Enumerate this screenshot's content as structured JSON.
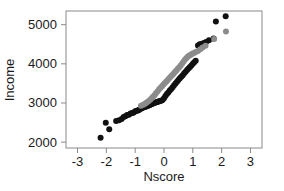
{
  "chart_data": {
    "type": "scatter",
    "title": "",
    "xlabel": "Nscore",
    "ylabel": "Income",
    "xlim": [
      -3.4,
      3.4
    ],
    "ylim": [
      1850,
      5350
    ],
    "xticks": [
      -3,
      -2,
      -1,
      0,
      1,
      2,
      3
    ],
    "xtick_labels": [
      "-3",
      "-2",
      "-1",
      "0",
      "1",
      "2",
      "3"
    ],
    "yticks": [
      2000,
      3000,
      4000,
      5000
    ],
    "ytick_labels": [
      "2000",
      "3000",
      "4000",
      "5000"
    ],
    "grid": false,
    "legend": "none",
    "frame": true,
    "series": [
      {
        "name": "black-series",
        "color": "#111111",
        "marker": "filled-circle",
        "marker_size": 3.0,
        "points": [
          [
            -2.2,
            2110
          ],
          [
            -2.02,
            2495
          ],
          [
            -1.9,
            2330
          ],
          [
            -1.66,
            2540
          ],
          [
            -1.56,
            2560
          ],
          [
            -1.47,
            2590
          ],
          [
            -1.4,
            2640
          ],
          [
            -1.34,
            2660
          ],
          [
            -1.28,
            2690
          ],
          [
            -1.22,
            2700
          ],
          [
            -1.16,
            2730
          ],
          [
            -1.1,
            2745
          ],
          [
            -1.05,
            2760
          ],
          [
            -1.0,
            2790
          ],
          [
            -0.95,
            2800
          ],
          [
            -0.9,
            2805
          ],
          [
            -0.86,
            2830
          ],
          [
            -0.82,
            2850
          ],
          [
            -0.78,
            2860
          ],
          [
            -0.74,
            2880
          ],
          [
            -0.7,
            2890
          ],
          [
            -0.66,
            2900
          ],
          [
            -0.62,
            2910
          ],
          [
            -0.58,
            2920
          ],
          [
            -0.54,
            2935
          ],
          [
            -0.5,
            2945
          ],
          [
            -0.46,
            2960
          ],
          [
            -0.42,
            2975
          ],
          [
            -0.38,
            2985
          ],
          [
            -0.34,
            3000
          ],
          [
            -0.3,
            3010
          ],
          [
            -0.26,
            3020
          ],
          [
            -0.22,
            3030
          ],
          [
            -0.18,
            3040
          ],
          [
            -0.14,
            3050
          ],
          [
            -0.1,
            3060
          ],
          [
            -0.05,
            3075
          ],
          [
            0.0,
            3120
          ],
          [
            0.05,
            3180
          ],
          [
            0.1,
            3230
          ],
          [
            0.15,
            3270
          ],
          [
            0.2,
            3320
          ],
          [
            0.25,
            3360
          ],
          [
            0.3,
            3400
          ],
          [
            0.35,
            3450
          ],
          [
            0.4,
            3500
          ],
          [
            0.45,
            3545
          ],
          [
            0.5,
            3590
          ],
          [
            0.55,
            3630
          ],
          [
            0.6,
            3670
          ],
          [
            0.65,
            3710
          ],
          [
            0.7,
            3760
          ],
          [
            0.75,
            3800
          ],
          [
            0.8,
            3840
          ],
          [
            0.85,
            3880
          ],
          [
            0.9,
            3920
          ],
          [
            0.95,
            3960
          ],
          [
            1.0,
            4000
          ],
          [
            1.05,
            4040
          ],
          [
            1.1,
            4080
          ],
          [
            1.18,
            4470
          ],
          [
            1.24,
            4500
          ],
          [
            1.3,
            4510
          ],
          [
            1.38,
            4530
          ],
          [
            1.46,
            4560
          ],
          [
            1.56,
            4600
          ],
          [
            1.72,
            4650
          ],
          [
            1.8,
            5080
          ],
          [
            2.14,
            5215
          ]
        ]
      },
      {
        "name": "gray-series",
        "color": "#8c8c8c",
        "marker": "filled-circle",
        "marker_size": 3.0,
        "points": [
          [
            -0.8,
            2930
          ],
          [
            -0.72,
            2955
          ],
          [
            -0.66,
            2980
          ],
          [
            -0.6,
            3010
          ],
          [
            -0.54,
            3045
          ],
          [
            -0.48,
            3080
          ],
          [
            -0.43,
            3120
          ],
          [
            -0.38,
            3160
          ],
          [
            -0.33,
            3200
          ],
          [
            -0.28,
            3250
          ],
          [
            -0.22,
            3300
          ],
          [
            -0.17,
            3350
          ],
          [
            -0.12,
            3390
          ],
          [
            -0.07,
            3430
          ],
          [
            -0.02,
            3470
          ],
          [
            0.03,
            3510
          ],
          [
            0.08,
            3550
          ],
          [
            0.13,
            3590
          ],
          [
            0.18,
            3630
          ],
          [
            0.23,
            3670
          ],
          [
            0.28,
            3710
          ],
          [
            0.33,
            3750
          ],
          [
            0.38,
            3790
          ],
          [
            0.43,
            3830
          ],
          [
            0.48,
            3875
          ],
          [
            0.53,
            3915
          ],
          [
            0.58,
            3960
          ],
          [
            0.63,
            4010
          ],
          [
            0.68,
            4060
          ],
          [
            0.73,
            4110
          ],
          [
            0.78,
            4150
          ],
          [
            0.83,
            4190
          ],
          [
            0.88,
            4215
          ],
          [
            0.93,
            4235
          ],
          [
            0.98,
            4255
          ],
          [
            1.04,
            4275
          ],
          [
            1.1,
            4300
          ],
          [
            1.18,
            4330
          ],
          [
            1.26,
            4370
          ],
          [
            1.34,
            4420
          ],
          [
            1.44,
            4460
          ],
          [
            1.74,
            4635
          ],
          [
            2.15,
            4825
          ]
        ]
      }
    ]
  },
  "axes": {
    "x_title": "Nscore",
    "y_title": "Income"
  }
}
